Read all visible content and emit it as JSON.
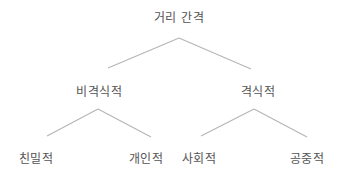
{
  "diagram": {
    "root": {
      "label": "거리 간격",
      "x": 179,
      "y": 16
    },
    "level1": [
      {
        "label": "비격식적",
        "x": 99,
        "y": 90
      },
      {
        "label": "격식적",
        "x": 258,
        "y": 90
      }
    ],
    "level2": [
      {
        "label": "친밀적",
        "x": 36,
        "y": 157
      },
      {
        "label": "개인적",
        "x": 146,
        "y": 157
      },
      {
        "label": "사회적",
        "x": 199,
        "y": 157
      },
      {
        "label": "공중적",
        "x": 307,
        "y": 157
      }
    ],
    "edges": [
      {
        "from": "거리 간격",
        "to": "비격식적",
        "x1": 179,
        "y1": 38,
        "x2": 108,
        "y2": 68
      },
      {
        "from": "거리 간격",
        "to": "격식적",
        "x1": 179,
        "y1": 38,
        "x2": 251,
        "y2": 69
      },
      {
        "from": "비격식적",
        "to": "친밀적",
        "x1": 98,
        "y1": 109,
        "x2": 47,
        "y2": 136
      },
      {
        "from": "비격식적",
        "to": "개인적",
        "x1": 98,
        "y1": 109,
        "x2": 151,
        "y2": 137
      },
      {
        "from": "격식적",
        "to": "사회적",
        "x1": 254,
        "y1": 109,
        "x2": 201,
        "y2": 136
      },
      {
        "from": "격식적",
        "to": "공중적",
        "x1": 254,
        "y1": 109,
        "x2": 307,
        "y2": 137
      }
    ],
    "colors": {
      "text": "#555555",
      "line": "#b5b5b5",
      "background": "#ffffff"
    }
  }
}
